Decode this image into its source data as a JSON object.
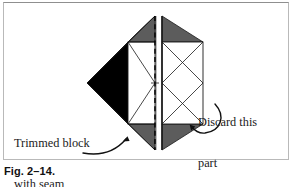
{
  "figure": {
    "caption": "Fig. 2–14.",
    "frame_color": "#b9b9b9",
    "background": "#ffffff"
  },
  "annotations": {
    "left_label": {
      "line1": "Trimmed block",
      "line2": "with seam",
      "line3": "allowance",
      "arrow": "curved-arrow-pointing-up-right"
    },
    "right_label": {
      "line1": "Discard this",
      "line2": "part",
      "arrow": "curved-arrow-pointing-up-left"
    }
  },
  "diagram": {
    "type": "quilt-block-trimming-diagram",
    "colors": {
      "dark_fill": "#000000",
      "gray_fill": "#5c5c5c",
      "white_fill": "#ffffff",
      "outline": "#1a1a1a",
      "cut_line": "#000000"
    },
    "parts": [
      {
        "name": "left-black-triangle",
        "fill": "#000000",
        "description": "Solid black triangle forming left point of the block"
      },
      {
        "name": "left-top-gray-triangle",
        "fill": "#5c5c5c",
        "description": "Gray triangle at top left of center square"
      },
      {
        "name": "left-bottom-gray-triangle",
        "fill": "#5c5c5c",
        "description": "Gray triangle at bottom left of center square"
      },
      {
        "name": "left-center-white-square",
        "fill": "#ffffff",
        "description": "White center square with X diagonals"
      },
      {
        "name": "right-top-gray-triangle",
        "fill": "#5c5c5c",
        "description": "Gray triangle at top right, discard side"
      },
      {
        "name": "right-bottom-gray-triangle",
        "fill": "#5c5c5c",
        "description": "Gray triangle at bottom right, discard side"
      },
      {
        "name": "right-center-white-square",
        "fill": "#ffffff",
        "description": "White center square with X diagonals, discard side"
      }
    ],
    "cut_line": {
      "name": "vertical-dashed-cut-line",
      "style": "dashed",
      "orientation": "vertical",
      "description": "Dashed vertical line marking where the block is cut"
    }
  }
}
